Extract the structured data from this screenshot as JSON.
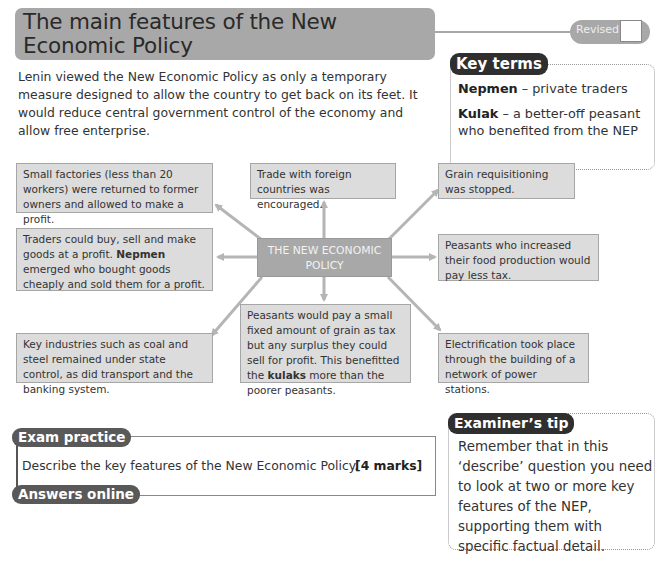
{
  "header": {
    "title": "The main features of the New Economic Policy",
    "revised_label": "Revised"
  },
  "intro": "Lenin viewed the New Economic Policy as only a temporary measure designed to allow the country to get back on its feet. It would reduce central government control of the economy and allow free enterprise.",
  "key_terms": {
    "heading": "Key terms",
    "items": [
      {
        "term": "Nepmen",
        "definition": " – private traders"
      },
      {
        "term": "Kulak",
        "definition": " – a better-off peasant who benefited from the NEP"
      }
    ]
  },
  "diagram": {
    "center": "THE NEW ECONOMIC POLICY",
    "boxes": {
      "small_factories": "Small factories (less than 20 workers) were returned to former owners and allowed to make a profit.",
      "traders_pre": "Traders could buy, sell and make goods at a profit. ",
      "traders_bold": "Nepmen",
      "traders_post": " emerged who bought goods cheaply and sold them for a profit.",
      "key_industries": "Key industries such as coal and steel remained under state control, as did transport and the banking system.",
      "trade": "Trade with foreign countries was encouraged.",
      "peasants_fixed_pre": "Peasants would pay a small fixed amount of grain as tax but any surplus they could sell for profit. This benefitted the ",
      "peasants_fixed_bold": "kulaks",
      "peasants_fixed_post": " more than the poorer peasants.",
      "grain": "Grain requisitioning was stopped.",
      "peasants_increased": "Peasants who increased their food production would pay less tax.",
      "electrification": "Electrification took place through the building of a network of power stations."
    },
    "colors": {
      "box_fill": "#dcdcdc",
      "center_fill": "#a8a8a8",
      "arrow": "#b5b5b5"
    }
  },
  "exam_practice": {
    "heading": "Exam practice",
    "question": "Describe the key features of the New Economic Policy.",
    "marks": "[4 marks]",
    "answers_label": "Answers online"
  },
  "examiners_tip": {
    "heading": "Examiner’s tip",
    "text": "Remember that in this ‘describe’ question you need to look at two or more key features of the NEP, supporting them with specific factual detail."
  }
}
